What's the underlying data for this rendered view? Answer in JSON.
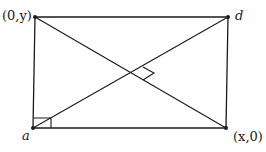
{
  "diagram": {
    "labels": {
      "top_left": "(0,y)",
      "top_right": "d",
      "bottom_left": "a",
      "bottom_right": "(x,0)"
    },
    "points": {
      "top_left": [
        35,
        17
      ],
      "top_right": [
        228,
        17
      ],
      "bottom_left": [
        33,
        128
      ],
      "bottom_right": [
        226,
        128
      ]
    },
    "line_color": "#1a1a1a"
  }
}
